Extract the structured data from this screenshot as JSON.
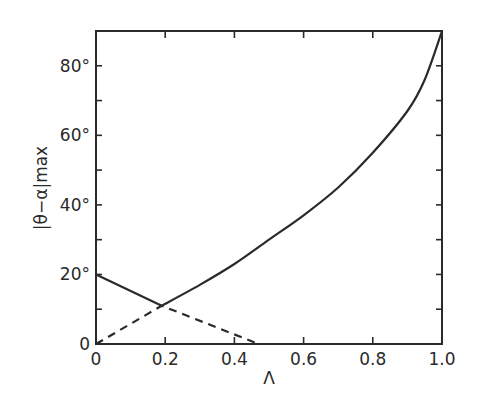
{
  "chart_data": {
    "type": "line",
    "title": "",
    "xlabel": "Λ",
    "ylabel": "|θ−α|max",
    "xlim": [
      0,
      1.0
    ],
    "ylim": [
      0,
      90
    ],
    "grid": false,
    "legend": null,
    "x_ticks": [
      {
        "value": 0,
        "label": "0"
      },
      {
        "value": 0.2,
        "label": "0.2"
      },
      {
        "value": 0.4,
        "label": "0.4"
      },
      {
        "value": 0.6,
        "label": "0.6"
      },
      {
        "value": 0.8,
        "label": "0.8"
      },
      {
        "value": 1.0,
        "label": "1.0"
      }
    ],
    "y_ticks": [
      {
        "value": 0,
        "label": "0"
      },
      {
        "value": 10,
        "label": ""
      },
      {
        "value": 20,
        "label": "20°"
      },
      {
        "value": 30,
        "label": ""
      },
      {
        "value": 40,
        "label": "40°"
      },
      {
        "value": 50,
        "label": ""
      },
      {
        "value": 60,
        "label": "60°"
      },
      {
        "value": 70,
        "label": ""
      },
      {
        "value": 80,
        "label": "80°"
      }
    ],
    "series": [
      {
        "name": "solid",
        "style": "solid",
        "x": [
          0,
          0.19,
          0.3,
          0.4,
          0.5,
          0.6,
          0.7,
          0.8,
          0.9,
          0.95,
          1.0
        ],
        "y": [
          20,
          11,
          17,
          23,
          30,
          37,
          45,
          55,
          67,
          76,
          90
        ]
      },
      {
        "name": "dashed",
        "style": "dashed",
        "x": [
          0,
          0.19,
          0.47
        ],
        "y": [
          0,
          11,
          0
        ]
      }
    ]
  },
  "colors": {
    "ink": "#2a2a2a",
    "background": "#ffffff"
  }
}
